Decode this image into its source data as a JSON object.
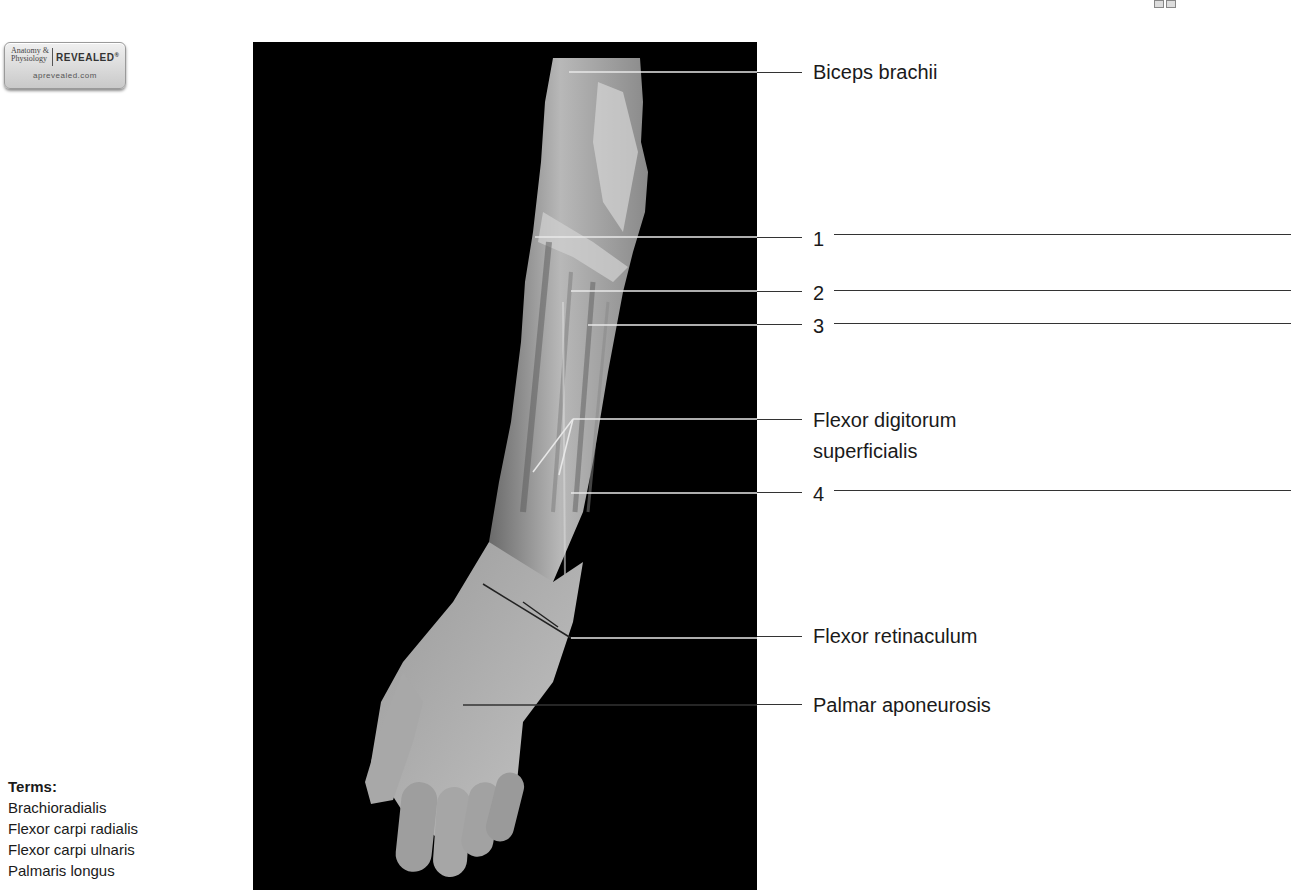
{
  "header": {
    "clipped": true,
    "figure_number_visible_fragment": "",
    "caption_visible_fragment": ""
  },
  "logo": {
    "line1": "Anatomy &",
    "line2": "Physiology",
    "brand": "REVEALED",
    "registered": "®",
    "url": "aprevealed.com"
  },
  "figure": {
    "photo_description": "Anterior view of dissected right forearm and hand showing superficial flexor muscles",
    "labels": [
      {
        "id": "biceps",
        "text": "Biceps brachii",
        "y": 72,
        "answer_blank": false
      },
      {
        "id": "n1",
        "text": "1",
        "y": 238,
        "answer_blank": true
      },
      {
        "id": "n2",
        "text": "2",
        "y": 292,
        "answer_blank": true
      },
      {
        "id": "n3",
        "text": "3",
        "y": 325,
        "answer_blank": true
      },
      {
        "id": "fds_line1",
        "text": "Flexor digitorum",
        "y": 420,
        "answer_blank": false
      },
      {
        "id": "fds_line2",
        "text": "superficialis",
        "y": 452,
        "answer_blank": false
      },
      {
        "id": "n4",
        "text": "4",
        "y": 492,
        "answer_blank": true
      },
      {
        "id": "retinaculum",
        "text": "Flexor retinaculum",
        "y": 635,
        "answer_blank": false
      },
      {
        "id": "aponeurosis",
        "text": "Palmar aponeurosis",
        "y": 705,
        "answer_blank": false
      }
    ]
  },
  "terms": {
    "title": "Terms:",
    "items": [
      "Brachioradialis",
      "Flexor carpi radialis",
      "Flexor carpi ulnaris",
      "Palmaris longus"
    ]
  }
}
